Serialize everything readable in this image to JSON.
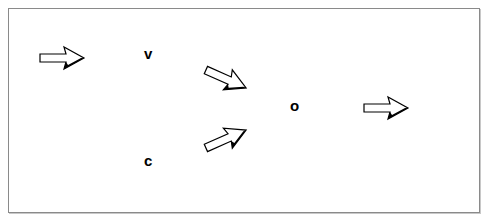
{
  "diagram": {
    "nodes": [
      {
        "id": "v",
        "label": "v"
      },
      {
        "id": "c",
        "label": "c"
      },
      {
        "id": "o",
        "label": "o"
      }
    ],
    "arrows": [
      {
        "id": "input-arrow",
        "direction": "right",
        "icon": "hollow-right-arrow-icon"
      },
      {
        "id": "v-to-o-arrow",
        "direction": "down-right",
        "icon": "hollow-diagonal-arrow-icon"
      },
      {
        "id": "c-to-o-arrow",
        "direction": "up-right",
        "icon": "hollow-diagonal-arrow-icon"
      },
      {
        "id": "output-arrow",
        "direction": "right",
        "icon": "hollow-right-arrow-icon"
      }
    ],
    "colors": {
      "frame_border": "#8a8a8a",
      "arrow_stroke": "#000000",
      "arrow_fill": "#ffffff"
    }
  }
}
